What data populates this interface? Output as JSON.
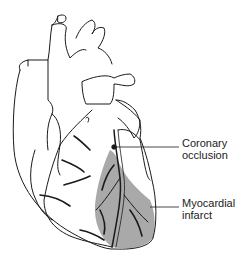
{
  "diagram": {
    "labels": {
      "coronary_occlusion": {
        "line1": "Coronary",
        "line2": "occlusion"
      },
      "myocardial_infarct": {
        "line1": "Myocardial",
        "line2": "infarct"
      }
    },
    "colors": {
      "outline": "#1a1a1a",
      "infarct_fill": "#a9a9a9",
      "background": "#ffffff"
    }
  }
}
